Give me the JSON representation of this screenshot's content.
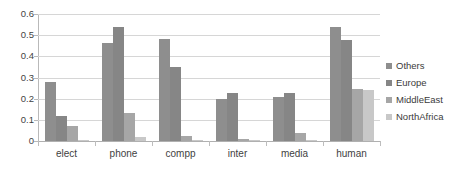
{
  "chart_data": {
    "type": "bar",
    "title": "",
    "subtitle": "",
    "xlabel": "",
    "ylabel": "",
    "ylim": [
      0,
      0.6
    ],
    "ytick_labels": [
      "0.6",
      "0.5",
      "0.4",
      "0.3",
      "0.2",
      "0.1",
      "0"
    ],
    "ytick_values": [
      0.6,
      0.5,
      0.4,
      0.3,
      0.2,
      0.1,
      0
    ],
    "grid": true,
    "legend_position": "right",
    "categories": [
      "elect",
      "phone",
      "compp",
      "inter",
      "media",
      "human"
    ],
    "series": [
      {
        "name": "Others",
        "color": "#8e8e8e",
        "values": [
          0.28,
          0.465,
          0.48,
          0.2,
          0.21,
          0.54
        ]
      },
      {
        "name": "Europe",
        "color": "#868686",
        "values": [
          0.12,
          0.54,
          0.35,
          0.225,
          0.225,
          0.475
        ]
      },
      {
        "name": "MiddleEast",
        "color": "#a6a6a6",
        "values": [
          0.07,
          0.13,
          0.025,
          0.01,
          0.04,
          0.245
        ]
      },
      {
        "name": "NorthAfrica",
        "color": "#c8c8c8",
        "values": [
          0.002,
          0.02,
          0.002,
          0.002,
          0.003,
          0.24
        ]
      }
    ]
  }
}
